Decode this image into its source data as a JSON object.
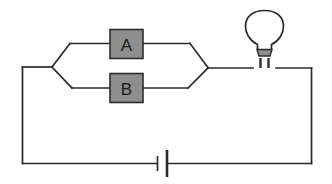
{
  "diagram": {
    "background_color": "#ffffff",
    "wire_color": "#2b2b2b",
    "component_fill": "#8e8e8e",
    "component_stroke": "#2e2e2e",
    "components": [
      {
        "id": "component-a",
        "label": "A",
        "type": "box",
        "branch": "top"
      },
      {
        "id": "component-b",
        "label": "B",
        "type": "box",
        "branch": "bottom"
      },
      {
        "id": "lamp",
        "label": "",
        "type": "light-bulb",
        "branch": "main-top-right"
      },
      {
        "id": "battery",
        "label": "",
        "type": "cell",
        "branch": "main-bottom"
      }
    ]
  }
}
